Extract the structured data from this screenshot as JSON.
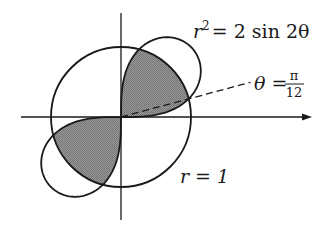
{
  "diagram": {
    "type": "polar-region",
    "canvas": {
      "width": 327,
      "height": 234,
      "background": "#ffffff"
    },
    "origin": {
      "x": 121,
      "y": 117
    },
    "scale_px_per_unit": 70,
    "axes": {
      "x": {
        "from": 21,
        "to": 312,
        "arrow": true
      },
      "y": {
        "from": 13,
        "to": 220,
        "arrow": false
      },
      "color": "#1a1a1a"
    },
    "curves": [
      {
        "id": "circle",
        "equation": "r = 1",
        "radius": 1,
        "stroke": "#1a1a1a"
      },
      {
        "id": "lemniscate",
        "equation": "r^2 = 2 sin 2θ",
        "amplitude_sq": 2,
        "stroke": "#1a1a1a"
      }
    ],
    "shaded_regions": {
      "fill": "#8c8c8c",
      "description": "Inside both r = 1 and r^2 = 2 sin 2θ (first and third quadrant lobes)",
      "intersection_angles_deg": [
        15,
        75
      ]
    },
    "ray": {
      "angle_deg": 15,
      "length_px": 134,
      "dashed": true
    },
    "labels": {
      "lemniscate": {
        "lhs": "r",
        "exp": "2",
        "rhs": "= 2 sin 2θ"
      },
      "angle": {
        "lhs": "θ =",
        "num": "π",
        "den": "12"
      },
      "circle": {
        "text": "r = 1"
      }
    }
  }
}
